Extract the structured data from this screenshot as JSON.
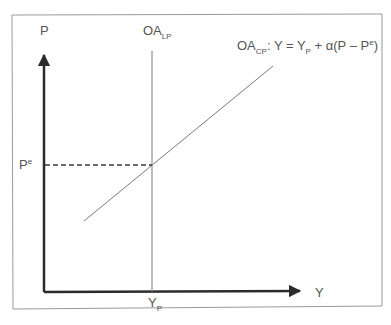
{
  "diagram": {
    "type": "economics-aggregate-supply",
    "colors": {
      "frame": "#9a9a9a",
      "axes": "#2b2b2b",
      "lines": "#7a7a7a",
      "dashed": "#3a3a3a",
      "text": "#555555"
    },
    "axes": {
      "y_label": "P",
      "x_label": "Y"
    },
    "curves": {
      "long_run": {
        "label_main": "OA",
        "label_sub": "LP"
      },
      "short_run": {
        "label_main": "OA",
        "label_sub": "CP",
        "equation_prefix": ": Y = Y",
        "equation_sub": "P",
        "equation_mid": " + α(P – P",
        "equation_sup": "e",
        "equation_suffix": ")"
      }
    },
    "markers": {
      "expected_price_main": "P",
      "expected_price_sup": "e",
      "potential_output_main": "Y",
      "potential_output_sub": "P"
    }
  }
}
